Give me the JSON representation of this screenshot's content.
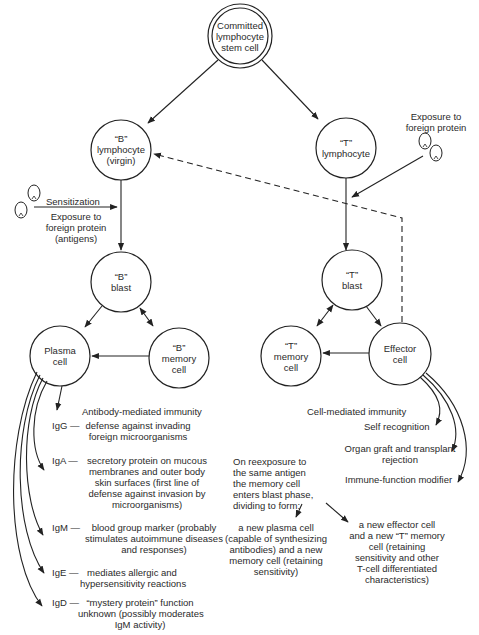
{
  "nodes": {
    "stem": {
      "label1": "Committed",
      "label2": "lymphocyte",
      "label3": "stem cell"
    },
    "b_lymph": {
      "label1": "“B”",
      "label2": "lymphocyte",
      "label3": "(virgin)"
    },
    "t_lymph": {
      "label1": "“T”",
      "label2": "lymphocyte"
    },
    "b_blast": {
      "label1": "“B”",
      "label2": "blast"
    },
    "t_blast": {
      "label1": "“T”",
      "label2": "blast"
    },
    "plasma": {
      "label1": "Plasma",
      "label2": "cell"
    },
    "b_memory": {
      "label1": "“B”",
      "label2": "memory",
      "label3": "cell"
    },
    "t_memory": {
      "label1": "“T”",
      "label2": "memory",
      "label3": "cell"
    },
    "effector": {
      "label1": "Effector",
      "label2": "cell"
    }
  },
  "annotations": {
    "sensitization": "Sensitization",
    "exposure_b": [
      "Exposure to",
      "foreign protein",
      "(antigens)"
    ],
    "exposure_t": [
      "Exposure to",
      "foreign protein"
    ],
    "antibody_mediated": "Antibody-mediated immunity",
    "cell_mediated": "Cell-mediated immunity",
    "self_recognition": "Self recognition",
    "organ_graft": [
      "Organ graft and transplant",
      "rejection"
    ],
    "immune_modifier": "Immune-function modifier",
    "reexposure": [
      "On reexposure to",
      "the same antigen",
      "the memory cell",
      "enters blast phase,",
      "dividing to form:"
    ],
    "new_plasma": [
      "a new plasma cell",
      "(capable of synthesizing",
      "antibodies) and a new",
      "memory cell (retaining",
      "sensitivity)"
    ],
    "new_effector": [
      "a new effector cell",
      "and a new “T” memory",
      "cell (retaining",
      "sensitivity and other",
      "T-cell differentiated",
      "characteristics)"
    ]
  },
  "immunoglobulins": [
    {
      "code": "IgG —",
      "lines": [
        "defense against invading",
        "foreign microorganisms"
      ]
    },
    {
      "code": "IgA —",
      "lines": [
        "secretory protein on mucous",
        "membranes and outer body",
        "skin surfaces (first line of",
        "defense against invasion by",
        "microorganisms)"
      ]
    },
    {
      "code": "IgM —",
      "lines": [
        "blood group marker (probably",
        "stimulates autoimmune diseases",
        "and responses)"
      ]
    },
    {
      "code": "IgE —",
      "lines": [
        "mediates allergic and",
        "hypersensitivity reactions"
      ]
    },
    {
      "code": "IgD —",
      "lines": [
        "“mystery protein” function",
        "unknown (possibly moderates",
        "IgM activity)"
      ]
    }
  ],
  "icons": {
    "antigen": "antigen-cell-icon"
  }
}
